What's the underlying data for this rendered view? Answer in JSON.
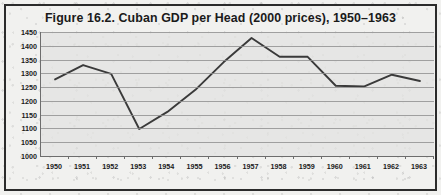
{
  "figure": {
    "title": "Figure 16.2. Cuban GDP per Head (2000 prices), 1950–1963",
    "frame_color": "#2b2b2b",
    "plot_bg_color": "#e2e2e0",
    "gridline_color": "#8d8d8d",
    "line_color": "#3a3a3a"
  },
  "chart_data": {
    "type": "line",
    "title": "Figure 16.2. Cuban GDP per Head (2000 prices), 1950–1963",
    "xlabel": "",
    "ylabel": "",
    "categories": [
      "1950",
      "1951",
      "1952",
      "1953",
      "1954",
      "1955",
      "1956",
      "1957",
      "1958",
      "1959",
      "1960",
      "1961",
      "1962",
      "1963"
    ],
    "x": [
      1950,
      1951,
      1952,
      1953,
      1954,
      1955,
      1956,
      1957,
      1958,
      1959,
      1960,
      1961,
      1962,
      1963
    ],
    "values": [
      1278,
      1330,
      1298,
      1098,
      1160,
      1240,
      1340,
      1428,
      1360,
      1360,
      1255,
      1252,
      1295,
      1272
    ],
    "series": [
      {
        "name": "Cuban GDP per head (2000 prices)",
        "values": [
          1278,
          1330,
          1298,
          1098,
          1160,
          1240,
          1340,
          1428,
          1360,
          1360,
          1255,
          1252,
          1295,
          1272
        ]
      }
    ],
    "ylim": [
      1000,
      1450
    ],
    "yticks": [
      1000,
      1050,
      1100,
      1150,
      1200,
      1250,
      1300,
      1350,
      1400,
      1450
    ],
    "ytick_labels": [
      "1000",
      "1050",
      "1100",
      "1150",
      "1200",
      "1250",
      "1300",
      "1350",
      "1400",
      "1450"
    ],
    "xtick_labels": [
      "1950",
      "1951",
      "1952",
      "1953",
      "1954",
      "1955",
      "1956",
      "1957",
      "1958",
      "1959",
      "1960",
      "1961",
      "1962",
      "1963"
    ],
    "grid": true,
    "grid_axis": "y",
    "legend": false,
    "legend_position": "none",
    "markers": false,
    "annotations": []
  }
}
